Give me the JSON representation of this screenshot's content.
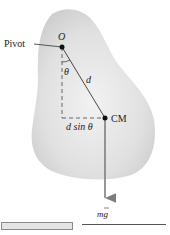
{
  "diagram": {
    "labels": {
      "pivot": "Pivot",
      "origin": "O",
      "theta": "θ",
      "distance": "d",
      "lever_arm": "d sin θ",
      "center_of_mass": "CM",
      "weight": "mg"
    },
    "colors": {
      "body_fill": "#e2e2e2",
      "line": "#333333",
      "arrow": "#7d7d7d"
    }
  },
  "footer": {
    "bar": "",
    "line": ""
  }
}
